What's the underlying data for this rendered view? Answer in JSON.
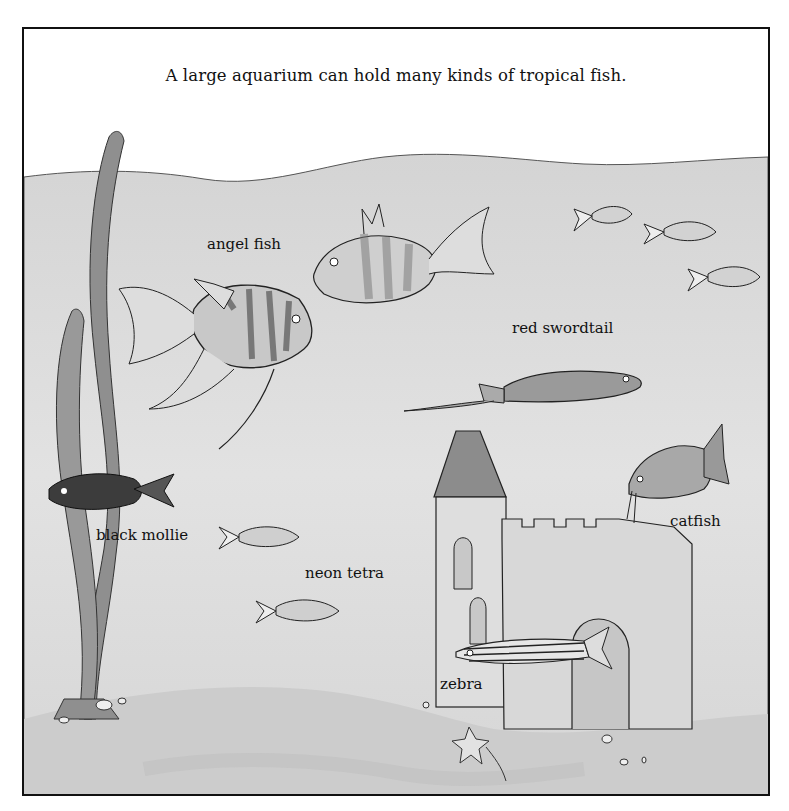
{
  "caption": "A large aquarium can hold many kinds of tropical fish.",
  "labels": {
    "angel_fish": "angel fish",
    "red_swordtail": "red swordtail",
    "black_mollie": "black mollie",
    "neon_tetra": "neon tetra",
    "catfish": "catfish",
    "zebra": "zebra"
  },
  "colors": {
    "water": "#d9d9d9",
    "water_light": "#e6e6e6",
    "sand": "#cfcfcf",
    "plant": "#8c8c8c",
    "outline": "#222222",
    "black_mollie": "#3a3a3a",
    "castle": "#dedede",
    "roof": "#8a8a8a"
  }
}
